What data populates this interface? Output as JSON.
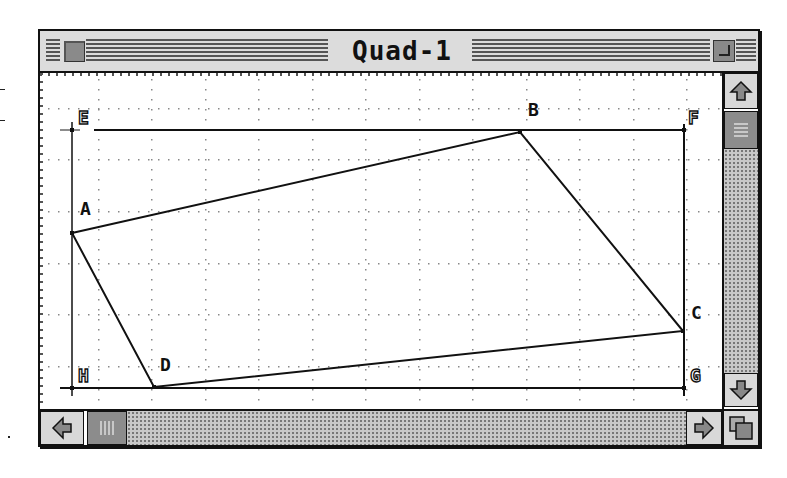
{
  "window": {
    "title": "Quad-1",
    "close_box": "close-box",
    "zoom_box": "zoom-box"
  },
  "canvas": {
    "grid": {
      "columns_x": [
        58,
        111,
        165,
        218,
        272,
        325,
        379,
        432,
        486,
        539,
        593,
        646
      ],
      "rows_y": [
        35,
        86,
        138,
        190,
        241,
        293,
        344
      ],
      "dot_spacing": 10
    },
    "points": {
      "E": {
        "label": "E",
        "x": 32,
        "y": 57,
        "style": "outline"
      },
      "F": {
        "label": "F",
        "x": 644,
        "y": 57,
        "style": "outline"
      },
      "G": {
        "label": "G",
        "x": 644,
        "y": 315,
        "style": "outline"
      },
      "H": {
        "label": "H",
        "x": 32,
        "y": 315,
        "style": "outline"
      },
      "A": {
        "label": "A",
        "x": 32,
        "y": 160,
        "style": "solid"
      },
      "B": {
        "label": "B",
        "x": 480,
        "y": 59,
        "style": "solid"
      },
      "C": {
        "label": "C",
        "x": 643,
        "y": 258,
        "style": "solid"
      },
      "D": {
        "label": "D",
        "x": 114,
        "y": 314,
        "style": "solid"
      }
    },
    "rectangle": [
      "E",
      "F",
      "G",
      "H"
    ],
    "quadrilateral": [
      "A",
      "B",
      "C",
      "D"
    ]
  },
  "scrollbars": {
    "vertical": {
      "up": "up-arrow",
      "down": "down-arrow",
      "thumb_position": 0
    },
    "horizontal": {
      "left": "left-arrow",
      "right": "right-arrow",
      "thumb_position": 0
    }
  },
  "colors": {
    "chrome": "#dcdcdc",
    "ink": "#111111",
    "grid_dot": "#888888"
  }
}
